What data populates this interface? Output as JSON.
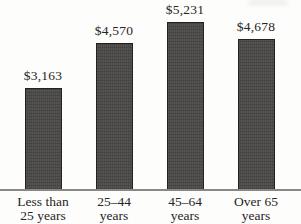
{
  "chart_data": {
    "type": "bar",
    "categories": [
      "Less than 25 years",
      "25–44 years",
      "45–64 years",
      "Over 65 years"
    ],
    "category_lines": [
      [
        "Less than",
        "25 years"
      ],
      [
        "25–44",
        "years"
      ],
      [
        "45–64",
        "years"
      ],
      [
        "Over 65",
        "years"
      ]
    ],
    "values": [
      3163,
      4570,
      5231,
      4678
    ],
    "value_labels": [
      "$3,163",
      "$4,570",
      "$5,231",
      "$4,678"
    ],
    "title": "",
    "xlabel": "",
    "ylabel": "",
    "ylim": [
      0,
      5900
    ],
    "grid": false,
    "legend": "none",
    "colors": {
      "bar_fill": "#4c4b49",
      "bar_border": "#22211f",
      "axis_line": "#8b8881",
      "text": "#28241f",
      "background": "#fdfdfc"
    }
  }
}
